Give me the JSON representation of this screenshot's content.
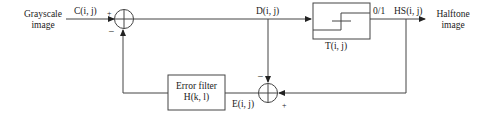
{
  "diagram": {
    "input": {
      "line1": "Grayscale",
      "line2": "image",
      "signal": "C(i, j)"
    },
    "sum1": {
      "plus": "+",
      "minus": "–"
    },
    "diff_signal": "D(i, j)",
    "threshold": {
      "label": "T(i, j)",
      "output_value": "0/1"
    },
    "output": {
      "signal": "HS(i, j)",
      "line1": "Halftone",
      "line2": "image"
    },
    "error_filter": {
      "line1": "Error filter",
      "line2": "H(k, l)"
    },
    "error_signal": "E(i, j)",
    "sum2": {
      "minus": "–",
      "plus": "+"
    }
  }
}
